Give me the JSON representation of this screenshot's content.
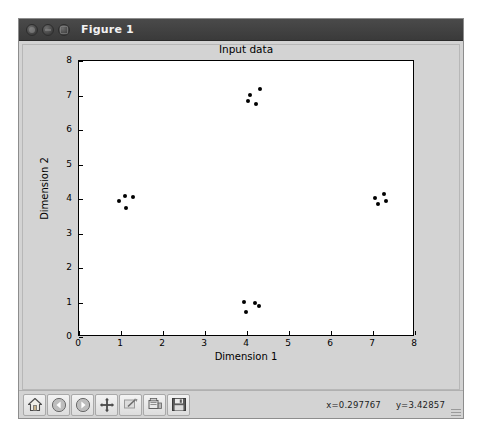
{
  "window": {
    "title": "Figure 1",
    "controls": [
      {
        "name": "close",
        "label": ""
      },
      {
        "name": "minimize",
        "label": ""
      },
      {
        "name": "maximize",
        "label": ""
      }
    ]
  },
  "toolbar": {
    "buttons": [
      {
        "name": "home-icon",
        "tooltip": "Reset original view"
      },
      {
        "name": "back-arrow-icon",
        "tooltip": "Back to previous view"
      },
      {
        "name": "forward-arrow-icon",
        "tooltip": "Forward to next view"
      },
      {
        "name": "pan-move-icon",
        "tooltip": "Pan axes with left mouse, zoom with right"
      },
      {
        "name": "zoom-rect-icon",
        "tooltip": "Zoom to rectangle"
      },
      {
        "name": "subplot-config-icon",
        "tooltip": "Configure subplots"
      },
      {
        "name": "save-disk-icon",
        "tooltip": "Save the figure"
      }
    ],
    "coordinates": {
      "x_text": "x=0.297767",
      "y_text": "y=3.42857"
    }
  },
  "chart_data": {
    "type": "scatter",
    "title": "Input data",
    "xlabel": "Dimension 1",
    "ylabel": "Dimension 2",
    "xlim": [
      0,
      8
    ],
    "ylim": [
      0,
      8
    ],
    "xticks": [
      0,
      1,
      2,
      3,
      4,
      5,
      6,
      7,
      8
    ],
    "yticks": [
      0,
      1,
      2,
      3,
      4,
      5,
      6,
      7,
      8
    ],
    "xticklabels": [
      "0",
      "1",
      "2",
      "3",
      "4",
      "5",
      "6",
      "7",
      "8"
    ],
    "yticklabels": [
      "0",
      "1",
      "2",
      "3",
      "4",
      "5",
      "6",
      "7",
      "8"
    ],
    "grid": false,
    "legend": null,
    "marker": "circle",
    "marker_color": "#000000",
    "marker_size": 4,
    "series": [
      {
        "name": "input points",
        "points": [
          [
            4.08,
            7.02
          ],
          [
            4.3,
            7.18
          ],
          [
            4.02,
            6.85
          ],
          [
            4.22,
            6.76
          ],
          [
            1.1,
            4.1
          ],
          [
            1.28,
            4.06
          ],
          [
            0.95,
            3.93
          ],
          [
            1.12,
            3.74
          ],
          [
            7.04,
            4.02
          ],
          [
            7.26,
            4.15
          ],
          [
            7.12,
            3.86
          ],
          [
            7.3,
            3.95
          ],
          [
            3.93,
            1.02
          ],
          [
            4.18,
            1.0
          ],
          [
            4.28,
            0.9
          ],
          [
            3.98,
            0.72
          ]
        ]
      }
    ]
  }
}
